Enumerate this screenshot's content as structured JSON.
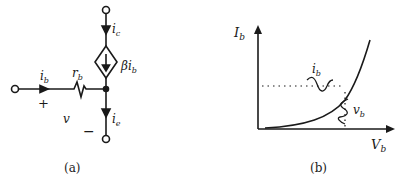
{
  "figure_a": {
    "caption": "(a)",
    "labels": {
      "ic": "i",
      "ic_sub": "c",
      "source": "βi",
      "source_sub": "b",
      "ib": "i",
      "ib_sub": "b",
      "rb": "r",
      "rb_sub": "b",
      "plus": "+",
      "v": "v",
      "minus": "−",
      "ie": "i",
      "ie_sub": "e"
    }
  },
  "figure_b": {
    "caption": "(b)",
    "labels": {
      "y_axis": "I",
      "y_axis_sub": "b",
      "x_axis": "V",
      "x_axis_sub": "b",
      "ib": "i",
      "ib_sub": "b",
      "vb": "v",
      "vb_sub": "b"
    }
  },
  "colors": {
    "ink": "#1a1a1a",
    "background": "#ffffff"
  }
}
